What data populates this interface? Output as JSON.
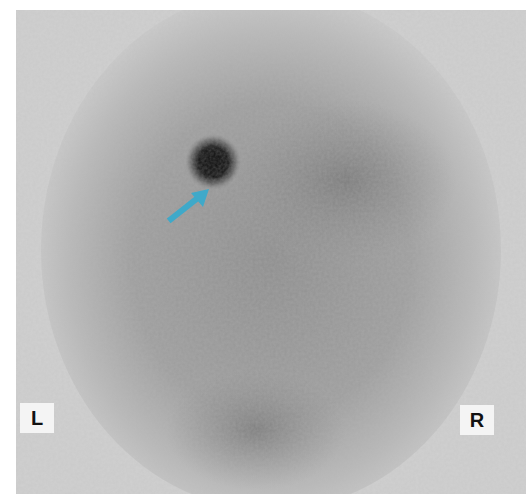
{
  "image": {
    "type": "planar scintigraphy (grayscale nuclear medicine scan)",
    "background_color": "#c4c4c4",
    "hotspot": {
      "description": "focal dark uptake spot",
      "center_x": 213,
      "center_y": 162,
      "radius": 16
    },
    "arrow": {
      "color": "#3fa9c9",
      "points_to": "hotspot",
      "direction": "up-right"
    }
  },
  "labels": {
    "left": "L",
    "right": "R"
  }
}
